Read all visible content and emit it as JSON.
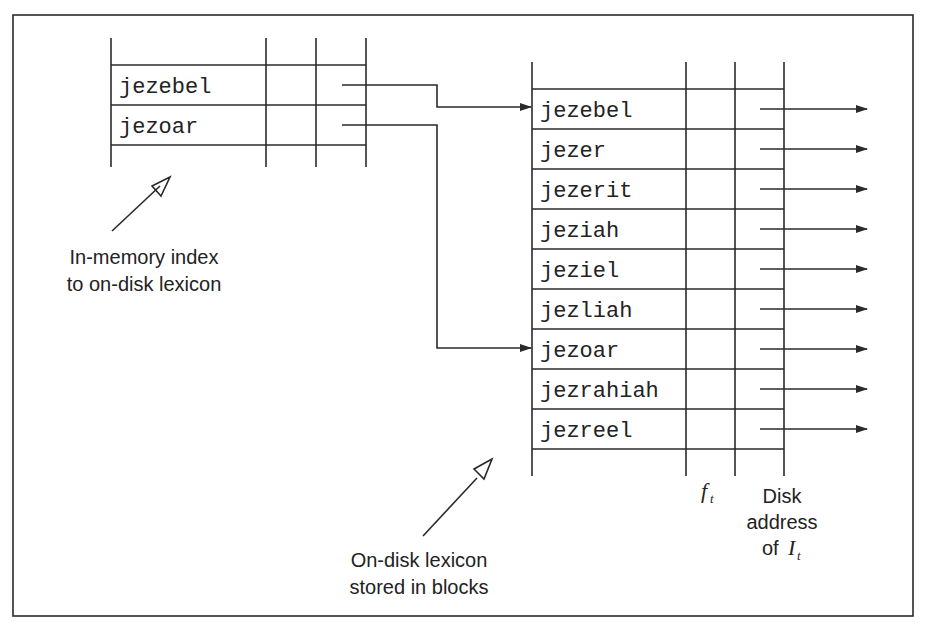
{
  "diagram": {
    "in_memory_index": {
      "entries": [
        "jezebel",
        "jezoar"
      ],
      "caption_line1": "In-memory index",
      "caption_line2": "to on-disk lexicon"
    },
    "on_disk_lexicon": {
      "entries": [
        "jezebel",
        "jezer",
        "jezerit",
        "jeziah",
        "jeziel",
        "jezliah",
        "jezoar",
        "jezrahiah",
        "jezreel"
      ],
      "caption_line1": "On-disk lexicon",
      "caption_line2": "stored in blocks",
      "column_labels": {
        "frequency": {
          "symbol": "f",
          "subscript": "t"
        },
        "address_line1": "Disk",
        "address_line2": "address",
        "address_line3_prefix": "of ",
        "address_symbol": "I",
        "address_subscript": "t"
      }
    },
    "pointers": [
      {
        "from": "jezebel",
        "to": "jezebel"
      },
      {
        "from": "jezoar",
        "to": "jezoar"
      }
    ],
    "colors": {
      "line": "#2a2a2a",
      "text": "#222222",
      "background": "#ffffff"
    }
  }
}
